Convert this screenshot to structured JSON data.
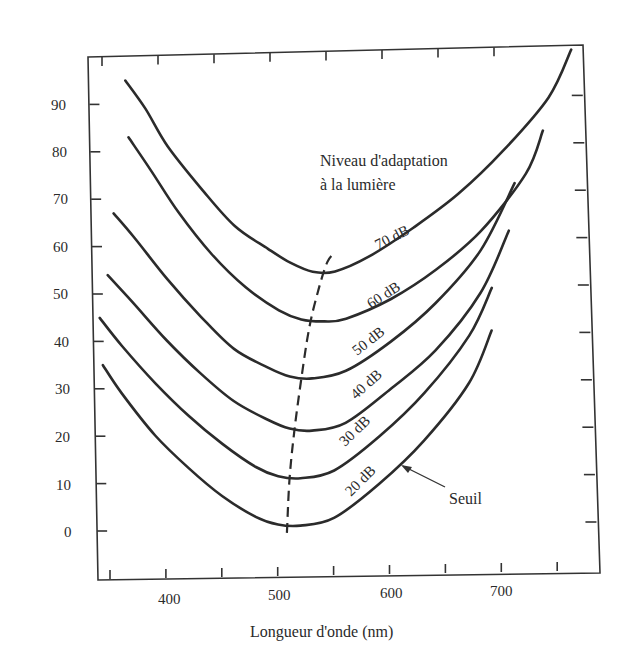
{
  "chart_data": {
    "type": "line",
    "title": "",
    "xlabel": "Longueur d'onde (nm)",
    "ylabel": "",
    "xlim": [
      340,
      760
    ],
    "ylim": [
      -10,
      100
    ],
    "x_ticks": [
      350,
      400,
      450,
      500,
      550,
      600,
      650,
      700,
      750
    ],
    "x_tick_labels": [
      "400",
      "500",
      "600",
      "700"
    ],
    "y_ticks": [
      0,
      10,
      20,
      30,
      40,
      50,
      60,
      70,
      80,
      90
    ],
    "y_tick_labels": [
      "0",
      "10",
      "20",
      "30",
      "40",
      "50",
      "60",
      "70",
      "80",
      "90"
    ],
    "grid": false,
    "legend_title": "Niveau d'adaptation à la lumière",
    "series": [
      {
        "name": "70 dB",
        "x": [
          362,
          380,
          400,
          430,
          460,
          490,
          510,
          530,
          550,
          580,
          620,
          660,
          700,
          740,
          760
        ],
        "values": [
          95,
          89,
          81,
          72,
          64,
          59,
          56,
          54,
          54,
          57,
          63,
          70,
          79,
          90,
          100
        ]
      },
      {
        "name": "60 dB",
        "x": [
          365,
          385,
          410,
          440,
          470,
          500,
          520,
          540,
          560,
          600,
          640,
          680,
          720,
          735
        ],
        "values": [
          83,
          76,
          67,
          58,
          51,
          46,
          44,
          43.5,
          44,
          48,
          54,
          62,
          74,
          83
        ]
      },
      {
        "name": "50 dB",
        "x": [
          352,
          370,
          400,
          430,
          460,
          490,
          510,
          530,
          560,
          600,
          640,
          680,
          710
        ],
        "values": [
          67,
          62,
          53,
          45,
          38,
          34,
          32,
          31.5,
          33,
          39,
          47,
          58,
          72
        ]
      },
      {
        "name": "40 dB",
        "x": [
          347,
          370,
          400,
          430,
          460,
          490,
          510,
          530,
          560,
          600,
          640,
          680,
          705
        ],
        "values": [
          54,
          48,
          40,
          33,
          27,
          23,
          21,
          20.5,
          22,
          29,
          37,
          49,
          62
        ]
      },
      {
        "name": "30 dB",
        "x": [
          340,
          360,
          390,
          420,
          450,
          480,
          500,
          520,
          550,
          590,
          630,
          670,
          690
        ],
        "values": [
          45,
          39,
          31,
          24,
          18,
          13,
          11,
          10.5,
          12,
          19,
          28,
          40,
          50
        ]
      },
      {
        "name": "20 dB",
        "x": [
          343,
          360,
          390,
          420,
          450,
          480,
          500,
          520,
          550,
          590,
          630,
          670,
          690
        ],
        "values": [
          35,
          29,
          20,
          13,
          7,
          2.5,
          0.8,
          0.5,
          2,
          9,
          18,
          30,
          41
        ]
      }
    ],
    "minima_locus": {
      "style": "dashed",
      "x": [
        508,
        510,
        514,
        520,
        527,
        535,
        543,
        550
      ],
      "values": [
        -1,
        10,
        20,
        31,
        42,
        50,
        56,
        58
      ]
    },
    "annotations": [
      {
        "text": "Niveau d'adaptation",
        "line": 1
      },
      {
        "text": "à la lumière",
        "line": 2
      },
      {
        "text": "Seuil",
        "points_to": "20 dB"
      }
    ]
  },
  "labels": {
    "xlabel": "Longueur d'onde (nm)",
    "legend_line1": "Niveau d'adaptation",
    "legend_line2": "à la lumière",
    "seuil": "Seuil",
    "y": [
      "0",
      "10",
      "20",
      "30",
      "40",
      "50",
      "60",
      "70",
      "80",
      "90"
    ],
    "x": [
      "400",
      "500",
      "600",
      "700"
    ],
    "curves": [
      "70 dB",
      "60 dB",
      "50 dB",
      "40 dB",
      "30 dB",
      "20 dB"
    ]
  }
}
